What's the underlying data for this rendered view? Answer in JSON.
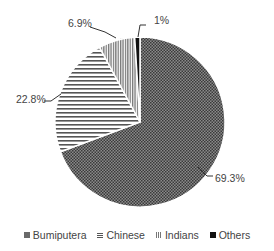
{
  "chart_data": {
    "type": "pie",
    "title": "",
    "categories": [
      "Bumiputera",
      "Chinese",
      "Indians",
      "Others"
    ],
    "values": [
      69.3,
      22.8,
      6.9,
      1.0
    ],
    "labels": [
      "69.3%",
      "22.8%",
      "6.9%",
      "1%"
    ],
    "start_angle_deg": 0,
    "direction": "clockwise",
    "legend_position": "bottom",
    "patterns": [
      "dense-dots",
      "horizontal-lines",
      "vertical-lines",
      "solid-black"
    ]
  },
  "legend": {
    "items": [
      {
        "label": "Bumiputera"
      },
      {
        "label": "Chinese"
      },
      {
        "label": "Indians"
      },
      {
        "label": "Others"
      }
    ]
  },
  "colors": {
    "bumiputera": "#6a6a6a",
    "chinese": "#555555",
    "indians": "#777777",
    "others": "#111111",
    "text": "#444444"
  }
}
